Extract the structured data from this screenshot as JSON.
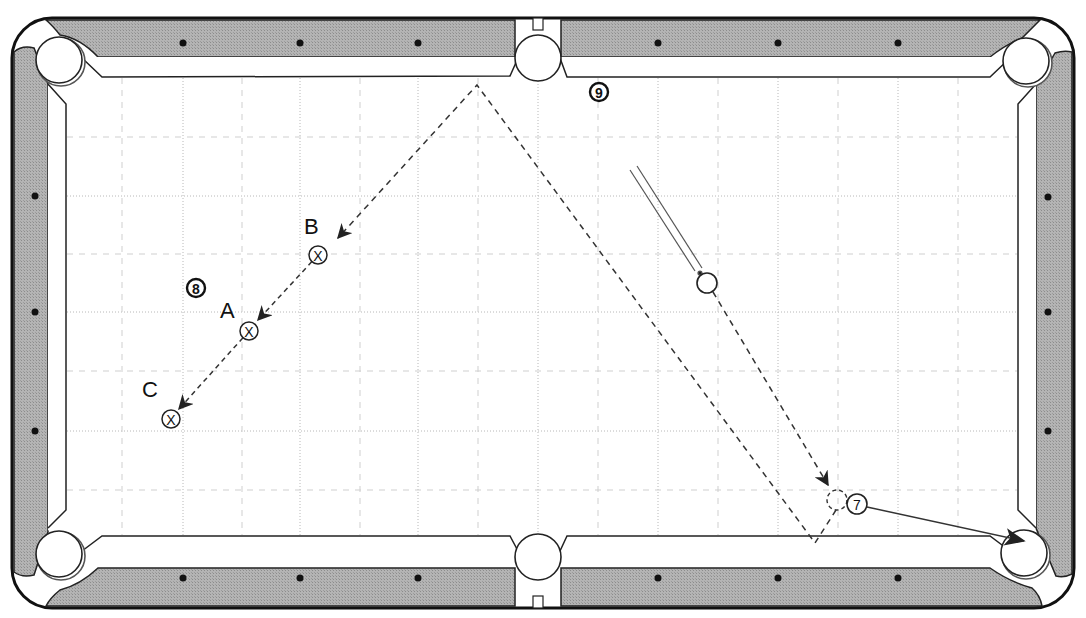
{
  "diagram": {
    "type": "billiards-table-diagram",
    "colors": {
      "rail": "#a8a8a8",
      "rail_outline": "#222222",
      "cloth": "#ffffff",
      "grid_major": "#9a9a9a",
      "grid_minor": "#bdbdbd",
      "path": "#333333",
      "diamond": "#111111"
    },
    "pockets": [
      {
        "id": "top-left",
        "cx": 60,
        "cy": 60
      },
      {
        "id": "top-middle",
        "cx": 538,
        "cy": 58
      },
      {
        "id": "top-right",
        "cx": 1026,
        "cy": 62
      },
      {
        "id": "bottom-left",
        "cx": 60,
        "cy": 555
      },
      {
        "id": "bottom-middle",
        "cx": 538,
        "cy": 556
      },
      {
        "id": "bottom-right",
        "cx": 1024,
        "cy": 553
      }
    ],
    "diamonds": {
      "top": [
        [
          183,
          43
        ],
        [
          300,
          43
        ],
        [
          418,
          43
        ],
        [
          658,
          43
        ],
        [
          778,
          43
        ],
        [
          898,
          43
        ]
      ],
      "bottom": [
        [
          183,
          578
        ],
        [
          300,
          578
        ],
        [
          418,
          578
        ],
        [
          658,
          578
        ],
        [
          778,
          578
        ],
        [
          898,
          578
        ]
      ],
      "left": [
        [
          35,
          196
        ],
        [
          35,
          312
        ],
        [
          35,
          431
        ]
      ],
      "right": [
        [
          1048,
          197
        ],
        [
          1048,
          312
        ],
        [
          1048,
          431
        ]
      ]
    },
    "balls": {
      "cue": {
        "label": "",
        "cx": 707,
        "cy": 283,
        "r": 10
      },
      "seven": {
        "label": "7",
        "cx": 857,
        "cy": 504,
        "r": 10
      },
      "eight": {
        "label": "8",
        "cx": 196,
        "cy": 288,
        "r": 9
      },
      "nine": {
        "label": "9",
        "cx": 599,
        "cy": 92,
        "r": 9
      }
    },
    "targets": [
      {
        "id": "A",
        "label": "A",
        "mark": "X",
        "cx": 249,
        "cy": 331,
        "label_x": 220,
        "label_y": 318
      },
      {
        "id": "B",
        "label": "B",
        "mark": "X",
        "cx": 318,
        "cy": 255,
        "label_x": 304,
        "label_y": 234
      },
      {
        "id": "C",
        "label": "C",
        "mark": "X",
        "cx": 171,
        "cy": 419,
        "label_x": 142,
        "label_y": 397
      }
    ],
    "ghost_ball": {
      "cx": 837,
      "cy": 500
    },
    "cue_stick": {
      "from": [
        633,
        168
      ],
      "to": [
        697,
        272
      ]
    },
    "cue_ball_path": [
      [
        707,
        283
      ],
      [
        825,
        482
      ]
    ],
    "cue_ball_bounce": [
      [
        837,
        500
      ],
      [
        815,
        543
      ],
      [
        477,
        85
      ],
      [
        341,
        236
      ]
    ],
    "target_lines": {
      "B_to_A": [
        [
          318,
          255
        ],
        [
          254,
          321
        ]
      ],
      "A_to_C": [
        [
          249,
          331
        ],
        [
          178,
          410
        ]
      ]
    },
    "object_ball_path": {
      "from": [
        867,
        507
      ],
      "to": [
        1024,
        541
      ]
    }
  }
}
